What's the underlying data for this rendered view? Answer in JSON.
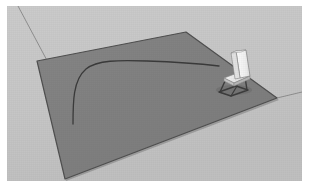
{
  "image": {
    "title": "3D room render with rug, chair and drawn path",
    "width": 309,
    "height": 189,
    "border": {
      "color": "#ffffff",
      "left": 7,
      "top": 6,
      "right": 7,
      "bottom": 8
    }
  },
  "scene": {
    "background": {
      "name": "floor-background",
      "color": "#c9c9c9",
      "shade_color": "#c2c2c2",
      "label": "Light grey floor"
    },
    "wall_lines": [
      {
        "name": "wall-edge-left",
        "label": "Left background edge",
        "color": "#8e8e8e",
        "points": "11,0 60,92"
      },
      {
        "name": "wall-edge-right",
        "label": "Right background edge",
        "color": "#8e8e8e",
        "points": "270,92 295,86"
      }
    ],
    "rug": {
      "name": "grey-rug",
      "label": "Dark grey rug quadrilateral",
      "fill": "#808080",
      "stroke": "#4f4f4f",
      "stroke_width": 1.2,
      "corners": {
        "top": [
          179,
          26
        ],
        "right": [
          270,
          92
        ],
        "bottom": [
          58,
          173
        ],
        "left": [
          30,
          55
        ]
      },
      "points": "179,26 270,92 58,173 30,55"
    },
    "path_curve": {
      "name": "drawn-path-curve",
      "label": "Dark hockey-stick curve drawn on rug",
      "color": "#3a3a3a",
      "stroke_width": 1.3,
      "d": "M 66,118 C 66,96 66,74 79,63 C 90,54 112,54 140,55 C 170,56 195,58 212,60"
    },
    "chair": {
      "name": "white-chair",
      "label": "White chair with dark cantilever frame",
      "seat_color": "#f2f2f2",
      "back_color": "#ededed",
      "side_color": "#cfcfcf",
      "frame_color": "#3c3c3c",
      "outline_color": "#777777",
      "position": {
        "x": 218,
        "y": 44,
        "width": 30,
        "height": 48
      }
    }
  }
}
